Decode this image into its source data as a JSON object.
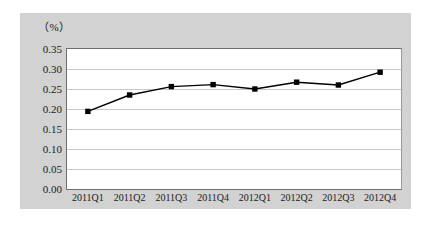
{
  "chart_data": {
    "type": "line",
    "title": "",
    "subtitle": "",
    "xlabel": "",
    "ylabel": "（%）",
    "categories": [
      "2011Q1",
      "2011Q2",
      "2011Q3",
      "2011Q4",
      "2012Q1",
      "2012Q2",
      "2012Q3",
      "2012Q4"
    ],
    "series": [
      {
        "name": "",
        "values": [
          0.194,
          0.235,
          0.256,
          0.261,
          0.25,
          0.267,
          0.26,
          0.292
        ],
        "color": "#000000",
        "marker": "square",
        "marker_color": "#000000"
      }
    ],
    "ylim": [
      0.0,
      0.35
    ],
    "ytick_labels": [
      "0.35",
      "0.30",
      "0.25",
      "0.20",
      "0.15",
      "0.10",
      "0.05",
      "0.00"
    ],
    "ytick_values": [
      0.35,
      0.3,
      0.25,
      0.2,
      0.15,
      0.1,
      0.05,
      0.0
    ],
    "grid": true,
    "grid_axis": "y",
    "legend": false,
    "legend_position": "none",
    "plot_background": "#ffffff",
    "figure_background": "#d2d2d2",
    "gridline_color": "#c8c8c8",
    "axis_color": "#6e6e6e",
    "text_color": "#1a1a1a"
  }
}
